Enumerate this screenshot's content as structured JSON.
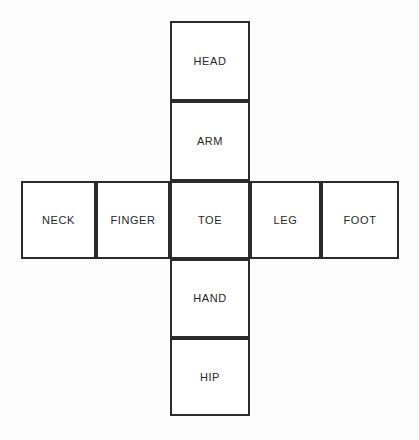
{
  "diagram": {
    "type": "cube-net",
    "shape": "cross",
    "stroke_color": "#2b2b2b",
    "fill_color": "#ffffff",
    "text_color": "#262626",
    "background_color": "#fdfdfd",
    "cells": [
      {
        "id": "head",
        "label": "HEAD",
        "row": 0,
        "col": 2
      },
      {
        "id": "arm",
        "label": "ARM",
        "row": 1,
        "col": 2
      },
      {
        "id": "neck",
        "label": "NECK",
        "row": 2,
        "col": 0
      },
      {
        "id": "finger",
        "label": "FINGER",
        "row": 2,
        "col": 1
      },
      {
        "id": "toe",
        "label": "TOE",
        "row": 2,
        "col": 2
      },
      {
        "id": "leg",
        "label": "LEG",
        "row": 2,
        "col": 3
      },
      {
        "id": "foot",
        "label": "FOOT",
        "row": 2,
        "col": 4
      },
      {
        "id": "hand",
        "label": "HAND",
        "row": 3,
        "col": 2
      },
      {
        "id": "hip",
        "label": "HIP",
        "row": 4,
        "col": 2
      }
    ]
  }
}
